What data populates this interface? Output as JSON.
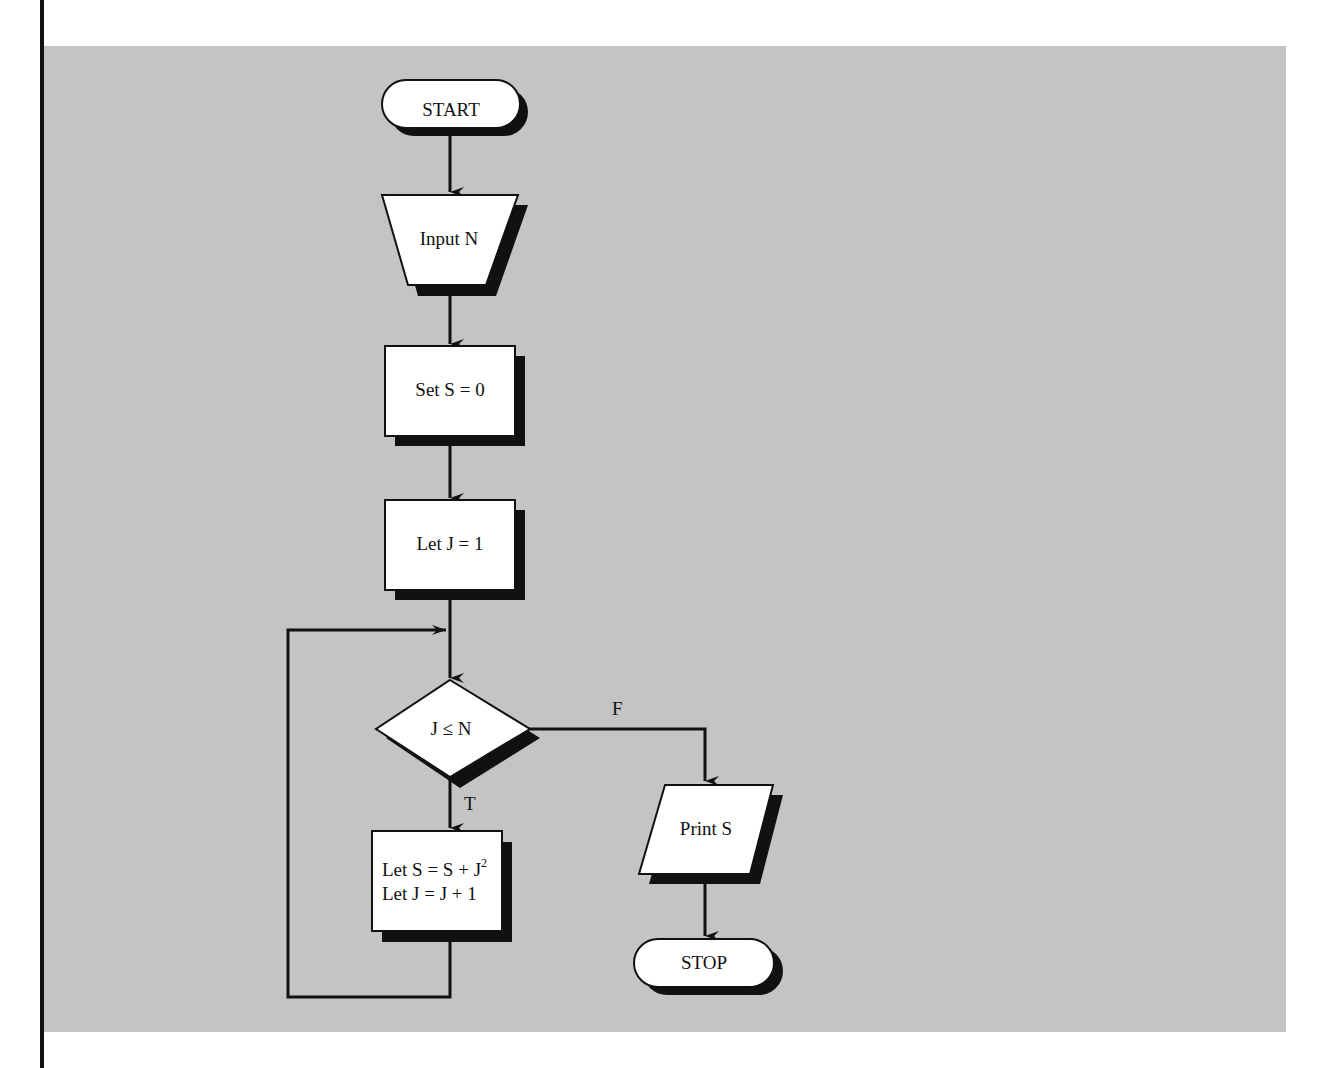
{
  "figure": {
    "title_cut_off": "FLOWCHART",
    "background_color": "#c4c4c4",
    "shape_fill": "#ffffff",
    "stroke_color": "#111111"
  },
  "nodes": {
    "start": {
      "type": "terminal",
      "label": "START"
    },
    "input": {
      "type": "manual-input",
      "label": "Input N"
    },
    "set_s": {
      "type": "process",
      "label": "Set S = 0"
    },
    "let_j": {
      "type": "process",
      "label": "Let J = 1"
    },
    "decision": {
      "type": "decision",
      "label": "J ≤ N"
    },
    "loop_body": {
      "type": "process",
      "line1": "Let S = S + J",
      "line1_sup": "2",
      "line2": "Let J = J + 1"
    },
    "print": {
      "type": "io",
      "label": "Print S"
    },
    "stop": {
      "type": "terminal",
      "label": "STOP"
    }
  },
  "edges": {
    "true_label": "T",
    "false_label": "F"
  }
}
